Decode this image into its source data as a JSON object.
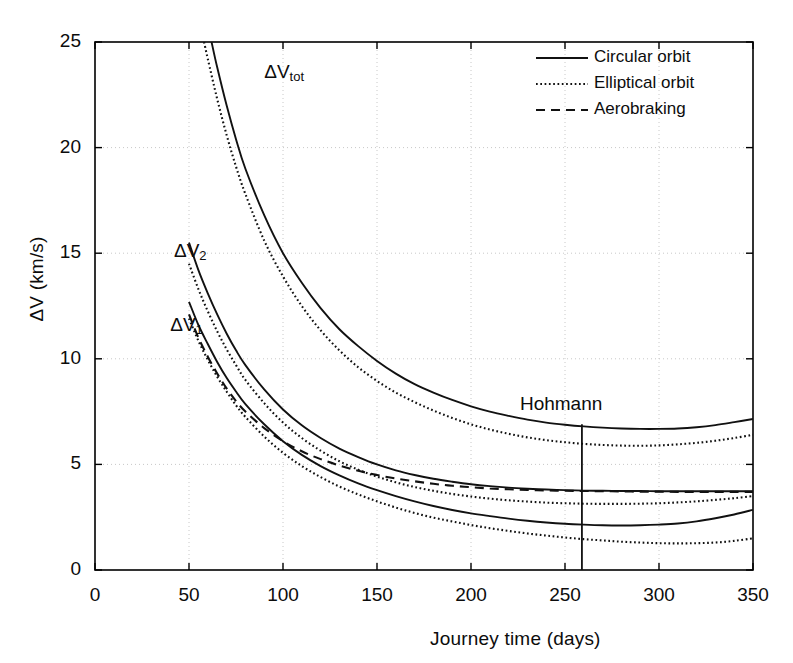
{
  "chart_data": {
    "type": "line",
    "title": "",
    "xlabel": "Journey time (days)",
    "ylabel": "ΔV (km/s)",
    "xlim": [
      0,
      350
    ],
    "ylim": [
      0,
      25
    ],
    "xticks": [
      0,
      50,
      100,
      150,
      200,
      250,
      300,
      350
    ],
    "yticks": [
      0,
      5,
      10,
      15,
      20,
      25
    ],
    "xtick_labels": [
      "0",
      "50",
      "100",
      "150",
      "200",
      "250",
      "300",
      "350"
    ],
    "ytick_labels": [
      "0",
      "5",
      "10",
      "15",
      "20",
      "25"
    ],
    "grid": true,
    "legend_position": "top-right",
    "legend": [
      {
        "label": "Circular orbit",
        "style": "solid"
      },
      {
        "label": "Elliptical orbit",
        "style": "dotted"
      },
      {
        "label": "Aerobraking",
        "style": "dashed"
      }
    ],
    "annotations": [
      {
        "name": "hohmann-marker",
        "label": "Hohmann",
        "x": 259,
        "y_top": 6.9,
        "y_bottom": 0
      },
      {
        "name": "dv-tot-label",
        "label": "ΔV",
        "sub": "tot",
        "x": 90,
        "y": 23.5
      },
      {
        "name": "dv2-label",
        "label": "ΔV",
        "sub": "2",
        "x": 42,
        "y": 15.0
      },
      {
        "name": "dv1-label",
        "label": "ΔV",
        "sub": "1",
        "x": 40,
        "y": 11.5
      }
    ],
    "series": [
      {
        "name": "dV_tot circular",
        "label": "ΔV_tot (Circular orbit)",
        "style": "solid",
        "x": [
          62,
          65,
          70,
          75,
          80,
          90,
          100,
          110,
          120,
          130,
          140,
          150,
          160,
          170,
          180,
          190,
          200,
          210,
          220,
          230,
          240,
          250,
          260,
          270,
          280,
          290,
          300,
          310,
          320,
          330,
          340,
          350
        ],
        "y": [
          25.0,
          23.8,
          22.0,
          20.4,
          19.0,
          16.8,
          15.0,
          13.6,
          12.4,
          11.4,
          10.6,
          9.9,
          9.3,
          8.8,
          8.4,
          8.05,
          7.75,
          7.5,
          7.3,
          7.12,
          6.98,
          6.88,
          6.8,
          6.74,
          6.7,
          6.68,
          6.68,
          6.7,
          6.76,
          6.86,
          7.0,
          7.15
        ]
      },
      {
        "name": "dV_tot elliptical",
        "label": "ΔV_tot (Elliptical orbit)",
        "style": "dotted",
        "x": [
          58,
          60,
          65,
          70,
          75,
          80,
          90,
          100,
          110,
          120,
          130,
          140,
          150,
          160,
          170,
          180,
          190,
          200,
          210,
          220,
          230,
          240,
          250,
          260,
          270,
          280,
          290,
          300,
          310,
          320,
          330,
          340,
          350
        ],
        "y": [
          25.0,
          24.2,
          22.3,
          20.6,
          19.1,
          17.8,
          15.6,
          13.9,
          12.5,
          11.35,
          10.4,
          9.6,
          8.95,
          8.4,
          7.95,
          7.55,
          7.2,
          6.9,
          6.65,
          6.45,
          6.28,
          6.15,
          6.05,
          5.97,
          5.92,
          5.89,
          5.88,
          5.9,
          5.95,
          6.02,
          6.12,
          6.25,
          6.4
        ]
      },
      {
        "name": "dV_2 circular",
        "label": "ΔV₂ (Circular orbit)",
        "style": "solid",
        "x": [
          50,
          55,
          60,
          65,
          70,
          75,
          80,
          90,
          100,
          110,
          120,
          130,
          140,
          150,
          160,
          170,
          180,
          190,
          200,
          210,
          220,
          230,
          240,
          250,
          260,
          270,
          280,
          290,
          300,
          310,
          320,
          330,
          340,
          350
        ],
        "y": [
          15.5,
          14.2,
          13.1,
          12.1,
          11.2,
          10.4,
          9.7,
          8.55,
          7.6,
          6.85,
          6.25,
          5.75,
          5.35,
          5.0,
          4.72,
          4.5,
          4.32,
          4.18,
          4.06,
          3.97,
          3.9,
          3.85,
          3.81,
          3.78,
          3.76,
          3.75,
          3.74,
          3.74,
          3.73,
          3.73,
          3.73,
          3.73,
          3.73,
          3.73
        ]
      },
      {
        "name": "dV_1 circular",
        "label": "ΔV₁ (Circular orbit)",
        "style": "solid",
        "x": [
          50,
          55,
          60,
          65,
          70,
          75,
          80,
          90,
          100,
          110,
          120,
          130,
          140,
          150,
          160,
          170,
          180,
          190,
          200,
          210,
          220,
          230,
          240,
          250,
          260,
          270,
          280,
          290,
          300,
          310,
          320,
          330,
          340,
          350
        ],
        "y": [
          12.7,
          11.6,
          10.7,
          9.85,
          9.1,
          8.45,
          7.85,
          6.9,
          6.1,
          5.45,
          4.92,
          4.48,
          4.1,
          3.78,
          3.5,
          3.25,
          3.03,
          2.84,
          2.68,
          2.55,
          2.43,
          2.33,
          2.25,
          2.19,
          2.15,
          2.12,
          2.11,
          2.12,
          2.15,
          2.2,
          2.3,
          2.45,
          2.63,
          2.85
        ]
      },
      {
        "name": "dV_2 elliptical",
        "label": "ΔV₂ (Elliptical orbit)",
        "style": "dotted",
        "x": [
          50,
          55,
          60,
          65,
          70,
          75,
          80,
          90,
          100,
          110,
          120,
          130,
          140,
          150,
          160,
          170,
          180,
          190,
          200,
          210,
          220,
          230,
          240,
          250,
          260,
          270,
          280,
          290,
          300,
          310,
          320,
          330,
          340,
          350
        ],
        "y": [
          14.5,
          13.3,
          12.25,
          11.3,
          10.45,
          9.7,
          9.0,
          7.9,
          6.98,
          6.25,
          5.65,
          5.15,
          4.75,
          4.42,
          4.15,
          3.93,
          3.75,
          3.6,
          3.48,
          3.38,
          3.3,
          3.24,
          3.19,
          3.16,
          3.14,
          3.13,
          3.13,
          3.14,
          3.16,
          3.2,
          3.25,
          3.32,
          3.4,
          3.5
        ]
      },
      {
        "name": "dV_1 elliptical",
        "label": "ΔV₁ (Elliptical orbit)",
        "style": "dotted",
        "x": [
          50,
          55,
          60,
          65,
          70,
          75,
          80,
          90,
          100,
          110,
          120,
          130,
          140,
          150,
          160,
          170,
          180,
          190,
          200,
          210,
          220,
          230,
          240,
          250,
          260,
          270,
          280,
          290,
          300,
          310,
          320,
          330,
          340,
          350
        ],
        "y": [
          11.9,
          10.85,
          9.95,
          9.15,
          8.45,
          7.8,
          7.25,
          6.32,
          5.55,
          4.92,
          4.4,
          3.95,
          3.58,
          3.25,
          2.96,
          2.7,
          2.48,
          2.3,
          2.13,
          1.98,
          1.85,
          1.73,
          1.63,
          1.54,
          1.46,
          1.4,
          1.34,
          1.3,
          1.27,
          1.26,
          1.27,
          1.3,
          1.38,
          1.5
        ]
      },
      {
        "name": "dV_1 aerobraking",
        "label": "ΔV₁ (Aerobraking)",
        "style": "dashed",
        "x": [
          50,
          55,
          60,
          65,
          70,
          75,
          80,
          90,
          100,
          110,
          120,
          130,
          140,
          150,
          160,
          170,
          180,
          190,
          200,
          210,
          220,
          230,
          240,
          250,
          260,
          270,
          280,
          290,
          300,
          310,
          320,
          330,
          340,
          350
        ],
        "y": [
          12.1,
          11.0,
          10.1,
          9.3,
          8.6,
          8.0,
          7.5,
          6.72,
          6.1,
          5.62,
          5.25,
          4.95,
          4.7,
          4.5,
          4.33,
          4.2,
          4.08,
          3.99,
          3.92,
          3.86,
          3.82,
          3.79,
          3.77,
          3.75,
          3.74,
          3.73,
          3.72,
          3.71,
          3.71,
          3.7,
          3.7,
          3.7,
          3.7,
          3.7
        ]
      }
    ]
  },
  "colors": {
    "line": "#111111",
    "axis": "#000000",
    "grid": "#c8c8c8",
    "background": "#ffffff"
  }
}
